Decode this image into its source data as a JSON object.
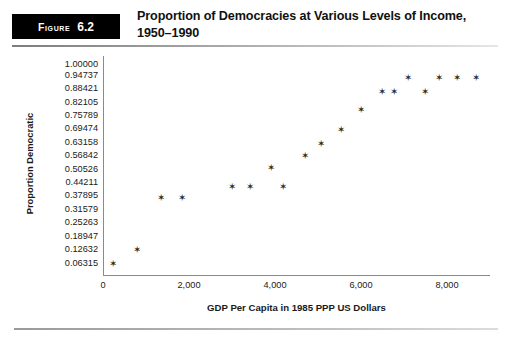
{
  "figure": {
    "badge_word": "Figure",
    "badge_number": "6.2",
    "title": "Proportion of Democracies at Various Levels of Income, 1950–1990"
  },
  "chart_data": {
    "type": "scatter",
    "title": "Proportion of Democracies at Various Levels of Income, 1950–1990",
    "xlabel": "GDP Per Capita in 1985 PPP US Dollars",
    "ylabel": "Proportion Democratic",
    "xlim": [
      0,
      9000
    ],
    "ylim": [
      0,
      1
    ],
    "grid": false,
    "legend": null,
    "marker": "star",
    "marker_color": "#2b2b2b",
    "xticks": [
      0,
      2000,
      4000,
      6000,
      8000
    ],
    "xticklabels": [
      "0",
      "2,000",
      "4,000",
      "6,000",
      "8,000"
    ],
    "yticks": [
      1.0,
      0.94737,
      0.88421,
      0.82105,
      0.75789,
      0.69474,
      0.63158,
      0.56842,
      0.50526,
      0.44211,
      0.37895,
      0.31579,
      0.25263,
      0.18947,
      0.12632,
      0.06315
    ],
    "yticklabels": [
      "1.00000",
      "0.94737",
      "0.88421",
      "0.82105",
      "0.75789",
      "0.69474",
      "0.63158",
      "0.56842",
      "0.50526",
      "0.44211",
      "0.37895",
      "0.31579",
      "0.25263",
      "0.18947",
      "0.12632",
      "0.06315"
    ],
    "x": [
      230,
      800,
      1350,
      1830,
      3010,
      3410,
      3910,
      4180,
      4690,
      5060,
      5540,
      6000,
      6480,
      6760,
      7100,
      7480,
      7810,
      8240,
      8670
    ],
    "y": [
      0.0589,
      0.1248,
      0.3693,
      0.3693,
      0.4211,
      0.4211,
      0.5104,
      0.4211,
      0.5693,
      0.6258,
      0.6917,
      0.7859,
      0.8706,
      0.8706,
      0.9365,
      0.8706,
      0.9365,
      0.9365,
      0.9365
    ],
    "points": [
      {
        "x": 230,
        "y": 0.0589
      },
      {
        "x": 800,
        "y": 0.1248
      },
      {
        "x": 1350,
        "y": 0.3693
      },
      {
        "x": 1830,
        "y": 0.3693
      },
      {
        "x": 3010,
        "y": 0.4211
      },
      {
        "x": 3410,
        "y": 0.4211
      },
      {
        "x": 3910,
        "y": 0.5104
      },
      {
        "x": 4180,
        "y": 0.4211
      },
      {
        "x": 4690,
        "y": 0.5693
      },
      {
        "x": 5060,
        "y": 0.6258
      },
      {
        "x": 5540,
        "y": 0.6917
      },
      {
        "x": 6000,
        "y": 0.7859
      },
      {
        "x": 6480,
        "y": 0.8706
      },
      {
        "x": 6760,
        "y": 0.8706
      },
      {
        "x": 7100,
        "y": 0.9365
      },
      {
        "x": 7480,
        "y": 0.8706
      },
      {
        "x": 7810,
        "y": 0.9365
      },
      {
        "x": 8240,
        "y": 0.9365
      },
      {
        "x": 8670,
        "y": 0.9365
      }
    ],
    "marker_glyph": "✶"
  }
}
